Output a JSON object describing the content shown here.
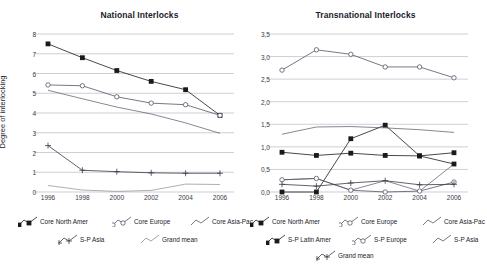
{
  "chart_data": [
    {
      "type": "line",
      "title": "National Interlocks",
      "xlabel": "",
      "ylabel": "Degree of interlocking",
      "x": [
        1996,
        1998,
        2000,
        2002,
        2004,
        2006
      ],
      "xtick_labels": [
        "1996",
        "1998",
        "2000",
        "2002",
        "2004",
        "2006"
      ],
      "ytick_labels": [
        "0",
        "1",
        "2",
        "3",
        "4",
        "5",
        "6",
        "7",
        "8"
      ],
      "ylim": [
        0,
        8
      ],
      "grid": true,
      "legend_position": "below",
      "series": [
        {
          "name": "Core North Amer",
          "marker": "filled-square",
          "color": "#1a1a1a",
          "values": [
            7.5,
            6.8,
            6.15,
            5.6,
            5.18,
            3.88
          ]
        },
        {
          "name": "Core Europe",
          "marker": "open-circle",
          "color": "#555566",
          "values": [
            5.42,
            5.38,
            4.82,
            4.5,
            4.42,
            3.88
          ]
        },
        {
          "name": "Core Asia-Pac",
          "marker": "none",
          "color": "#555566",
          "values": [
            5.15,
            4.72,
            4.3,
            3.95,
            3.5,
            2.97
          ]
        },
        {
          "name": "S-P Asia",
          "marker": "plus",
          "color": "#3a3a47",
          "values": [
            2.35,
            1.1,
            1.03,
            0.97,
            0.95,
            0.95
          ]
        },
        {
          "name": "Grand mean",
          "marker": "none",
          "color": "#8a8a96",
          "values": [
            0.33,
            0.1,
            0.03,
            0.08,
            0.4,
            0.38
          ]
        }
      ]
    },
    {
      "type": "line",
      "title": "Transnational Interlocks",
      "xlabel": "",
      "ylabel": "",
      "x": [
        1996,
        1998,
        2000,
        2002,
        2004,
        2006
      ],
      "xtick_labels": [
        "1996",
        "1998",
        "2000",
        "2002",
        "2004",
        "2006"
      ],
      "ytick_labels": [
        "0,0",
        "0,5",
        "1,0",
        "1,5",
        "2,0",
        "2,5",
        "3,0",
        "3,5"
      ],
      "ylim": [
        0.0,
        3.5
      ],
      "grid": true,
      "legend_position": "below",
      "series": [
        {
          "name": "Core North Amer",
          "marker": "filled-square",
          "color": "#1a1a1a",
          "values": [
            0.88,
            0.81,
            0.86,
            0.81,
            0.8,
            0.87
          ]
        },
        {
          "name": "Core Europe",
          "marker": "open-circle",
          "color": "#555566",
          "values": [
            2.7,
            3.15,
            3.05,
            2.77,
            2.77,
            2.53
          ]
        },
        {
          "name": "Core Asia-Pac",
          "marker": "none",
          "color": "#555566",
          "values": [
            0.27,
            0.3,
            0.04,
            0.25,
            0.02,
            0.62
          ]
        },
        {
          "name": "S-P Latin Amer",
          "marker": "filled-square",
          "color": "#1a1a1a",
          "values": [
            0.0,
            0.0,
            1.18,
            1.48,
            0.8,
            0.62
          ]
        },
        {
          "name": "S-P Europe",
          "marker": "open-circle",
          "color": "#555566",
          "values": [
            0.27,
            0.3,
            0.04,
            0.0,
            0.02,
            0.22
          ]
        },
        {
          "name": "S-P Asia",
          "marker": "none",
          "color": "#555566",
          "values": [
            1.28,
            1.44,
            1.45,
            1.42,
            1.38,
            1.32
          ]
        },
        {
          "name": "Grand mean",
          "marker": "plus",
          "color": "#3a3a47",
          "values": [
            0.17,
            0.13,
            0.2,
            0.25,
            0.16,
            0.17
          ]
        }
      ]
    }
  ]
}
